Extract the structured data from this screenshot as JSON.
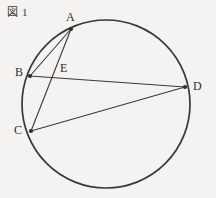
{
  "figure": {
    "caption_marker": "図",
    "caption_number": "1",
    "caption_full": "図 1",
    "type": "circle-with-inscribed-chords",
    "background_color": "#f4f3f1",
    "stroke_color": "#3a3937",
    "circle": {
      "center_x": 106,
      "center_y": 104,
      "radius": 84,
      "stroke_width": 1.6
    },
    "points": [
      {
        "id": "A",
        "label": "A",
        "x": 71,
        "y": 29,
        "marker": "dot"
      },
      {
        "id": "B",
        "label": "B",
        "x": 30,
        "y": 76,
        "marker": "dot"
      },
      {
        "id": "C",
        "label": "C",
        "x": 31,
        "y": 131,
        "marker": "dot"
      },
      {
        "id": "D",
        "label": "D",
        "x": 185,
        "y": 87,
        "marker": "dot"
      },
      {
        "id": "E",
        "label": "E",
        "x": 56,
        "y": 75,
        "marker": "none"
      }
    ],
    "segments": [
      {
        "id": "AB",
        "from": "A",
        "to": "B",
        "x1": 71,
        "y1": 29,
        "x2": 30,
        "y2": 76
      },
      {
        "id": "AC",
        "from": "A",
        "to": "C",
        "x1": 71,
        "y1": 29,
        "x2": 31,
        "y2": 131
      },
      {
        "id": "BD",
        "from": "B",
        "to": "D",
        "x1": 30,
        "y1": 76,
        "x2": 185,
        "y2": 87
      },
      {
        "id": "CD",
        "from": "C",
        "to": "D",
        "x1": 31,
        "y1": 131,
        "x2": 185,
        "y2": 87
      }
    ],
    "labels": {
      "A": "A",
      "B": "B",
      "C": "C",
      "D": "D",
      "E": "E"
    },
    "notes": {
      "intersection": "E is the intersection of chord AC and chord BD"
    }
  }
}
